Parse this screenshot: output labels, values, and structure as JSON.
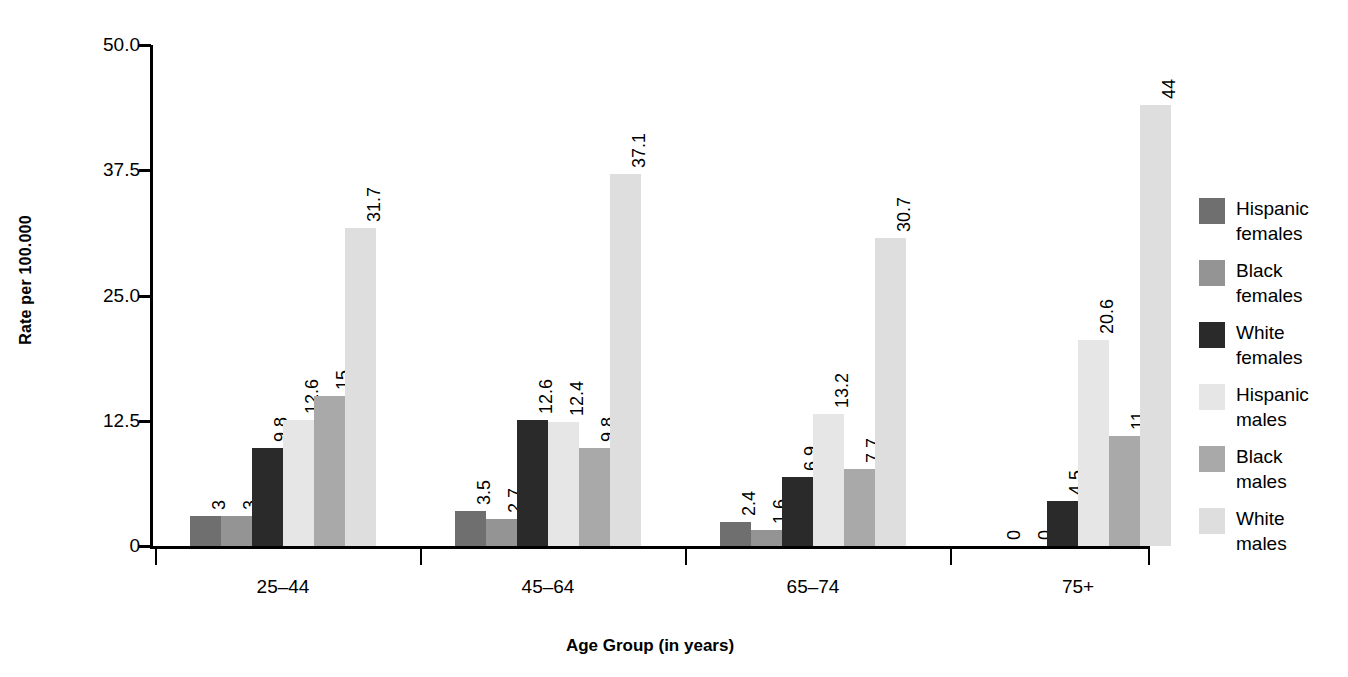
{
  "chart_data": {
    "type": "bar",
    "title": "",
    "subtitle": "",
    "xlabel": "Age Group (in years)",
    "ylabel": "Rate per 100.000",
    "categories": [
      "25–44",
      "45–64",
      "65–74",
      "75+"
    ],
    "ylim": [
      0,
      50
    ],
    "yticks": [
      0,
      12.5,
      25,
      37.5,
      50
    ],
    "ytick_labels": [
      "0",
      "12.5",
      "25.0",
      "37.5",
      "50.0"
    ],
    "grid": false,
    "legend_position": "right",
    "bar_value_labels": true,
    "bar_value_label_orientation": "vertical",
    "series": [
      {
        "name": "Hispanic females",
        "legend_label": "Hispanic\nfemales",
        "color": "#6f6f6f",
        "values": [
          3,
          3.5,
          2.4,
          0
        ],
        "value_labels": [
          "3",
          "3.5",
          "2.4",
          "0"
        ]
      },
      {
        "name": "Black females",
        "legend_label": "Black\nfemales",
        "color": "#949494",
        "values": [
          3,
          2.7,
          1.6,
          0
        ],
        "value_labels": [
          "3",
          "2.7",
          "1.6",
          "0"
        ]
      },
      {
        "name": "White females",
        "legend_label": "White\nfemales",
        "color": "#2a2a2a",
        "values": [
          9.8,
          12.6,
          6.9,
          4.5
        ],
        "value_labels": [
          "9.8",
          "12.6",
          "6.9",
          "4.5"
        ]
      },
      {
        "name": "Hispanic males",
        "legend_label": "Hispanic\nmales",
        "color": "#e6e6e6",
        "values": [
          12.6,
          12.4,
          13.2,
          20.6
        ],
        "value_labels": [
          "12.6",
          "12.4",
          "13.2",
          "20.6"
        ]
      },
      {
        "name": "Black males",
        "legend_label": "Black\nmales",
        "color": "#a9a9a9",
        "values": [
          15,
          9.8,
          7.7,
          11
        ],
        "value_labels": [
          "15",
          "9.8",
          "7.7",
          "11"
        ]
      },
      {
        "name": "White males",
        "legend_label": "White\nmales",
        "color": "#dedede",
        "values": [
          31.7,
          37.1,
          30.7,
          44
        ],
        "value_labels": [
          "31.7",
          "37.1",
          "30.7",
          "44"
        ]
      }
    ]
  },
  "axes": {
    "y_title": "Rate per 100.000",
    "x_title": "Age Group (in years)"
  }
}
